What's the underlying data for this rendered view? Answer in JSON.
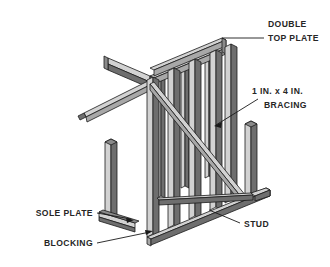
{
  "diagram": {
    "type": "technical-illustration",
    "background_color": "#ffffff",
    "line_color": "#1a1a1a",
    "lumber_light": "#d2d2d2",
    "lumber_mid": "#a8a8a8",
    "lumber_dark": "#6e6e6e"
  },
  "labels": {
    "double_top_plate": {
      "line1": "DOUBLE",
      "line2": "TOP PLATE",
      "x": 268,
      "y": 27,
      "align": "start"
    },
    "bracing": {
      "line1": "1 IN. x 4 IN.",
      "line2": "BRACING",
      "x": 252,
      "y": 94,
      "align": "start"
    },
    "sole_plate": {
      "line1": "SOLE PLATE",
      "x": 93,
      "y": 216,
      "align": "end"
    },
    "blocking": {
      "line1": "BLOCKING",
      "x": 93,
      "y": 246,
      "align": "end"
    },
    "stud": {
      "line1": "STUD",
      "x": 244,
      "y": 227,
      "align": "start"
    }
  },
  "leaders": [
    {
      "name": "double-top-plate-leader",
      "path": "M 264 38 L 222 38",
      "arrow": "none"
    },
    {
      "name": "bracing-leader",
      "path": "M 258 99 L 214 126",
      "arrow": "end"
    },
    {
      "name": "sole-plate-leader",
      "path": "M 97 214 L 133 220",
      "arrow": "end"
    },
    {
      "name": "blocking-leader",
      "path": "M 97 243 L 152 231",
      "arrow": "end"
    },
    {
      "name": "stud-leader",
      "path": "M 240 223 L 207 209",
      "arrow": "end"
    }
  ],
  "components": {
    "double_top_plate": "Two stacked 2x4 plates forming the top of the wall",
    "stud": "Vertical 2x4 framing members spaced along the wall",
    "sole_plate": "Bottom horizontal 2x4 plate",
    "blocking": "Short members between studs at the base",
    "bracing": "Diagonal 1 in. x 4 in. let-in brace"
  }
}
